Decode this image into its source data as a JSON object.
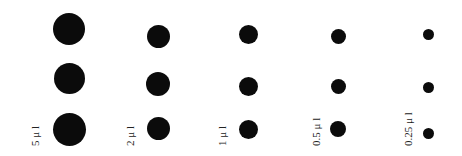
{
  "labels": [
    "5 μ l",
    "2 μ l",
    "1 μ l",
    "0.5 μ l",
    "0.25 μ l"
  ],
  "columns": [
    {
      "volume": "5 μl",
      "x": 69,
      "ys": [
        29,
        78,
        129
      ],
      "diameters": [
        32,
        31,
        33
      ]
    },
    {
      "volume": "2 μl",
      "x": 158,
      "ys": [
        36,
        84,
        128
      ],
      "diameters": [
        23,
        24,
        23
      ]
    },
    {
      "volume": "1 μl",
      "x": 248,
      "ys": [
        34,
        86,
        129
      ],
      "diameters": [
        19,
        19,
        19
      ]
    },
    {
      "volume": "0.5 μl",
      "x": 338,
      "ys": [
        36,
        86,
        129
      ],
      "diameters": [
        15,
        15,
        16
      ]
    },
    {
      "volume": "0.25 μl",
      "x": 428,
      "ys": [
        34,
        87,
        133
      ],
      "diameters": [
        11,
        11,
        11
      ]
    }
  ],
  "dot_color": "#0b0b0b"
}
